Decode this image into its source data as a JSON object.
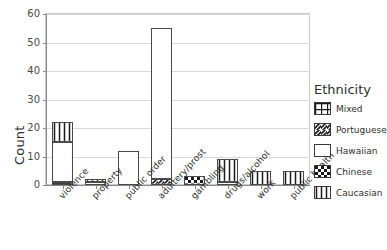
{
  "chart_data": {
    "type": "bar",
    "title": "",
    "xlabel": "",
    "ylabel": "Count",
    "ylim": [
      0,
      60
    ],
    "yticks": [
      0,
      10,
      20,
      30,
      40,
      50,
      60
    ],
    "grid": true,
    "stacked": true,
    "legend_position": "right",
    "legend_title": "Ethnicity",
    "categories": [
      "violence",
      "property",
      "public order",
      "adultery/prost",
      "gambling",
      "drugs/alcohol",
      "work",
      "public health"
    ],
    "series": [
      {
        "name": "Mixed",
        "pattern": "grid",
        "values": [
          1,
          0,
          0,
          0,
          0,
          0,
          0,
          0
        ]
      },
      {
        "name": "Portuguese",
        "pattern": "diagonal",
        "values": [
          0,
          0,
          0,
          2,
          0,
          0,
          0,
          0
        ]
      },
      {
        "name": "Hawaiian",
        "pattern": "solid",
        "values": [
          14,
          1,
          12,
          53,
          0,
          1,
          0,
          0
        ]
      },
      {
        "name": "Chinese",
        "pattern": "checker",
        "values": [
          0,
          0,
          0,
          0,
          3,
          0,
          0,
          0
        ]
      },
      {
        "name": "Caucasian",
        "pattern": "vertical",
        "values": [
          7,
          1,
          0,
          0,
          0,
          8,
          5,
          5
        ]
      }
    ],
    "totals": [
      22,
      2,
      12,
      55,
      3,
      9,
      5,
      5
    ]
  },
  "colors": {
    "axis": "#8a8a8a",
    "grid": "#d8d8d8",
    "bar_stroke": "#4a4a4a",
    "text": "#2e2e2e"
  }
}
